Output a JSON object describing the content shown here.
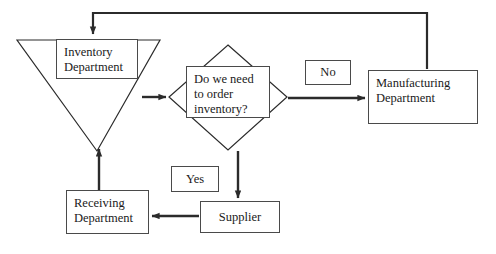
{
  "diagram": {
    "stroke_color": "#2b2b2b",
    "fill_color": "#ffffff",
    "text_color": "#1a1a1a",
    "nodes": {
      "inventory_department": {
        "label": "Inventory\nDepartment",
        "shape": "inverted-triangle"
      },
      "decision": {
        "label": "Do we need\nto order\ninventory?",
        "shape": "diamond"
      },
      "manufacturing_department": {
        "label": "Manufacturing\nDepartment",
        "shape": "rectangle"
      },
      "receiving_department": {
        "label": "Receiving\nDepartment",
        "shape": "rectangle"
      },
      "supplier": {
        "label": "Supplier",
        "shape": "rectangle"
      }
    },
    "edge_labels": {
      "yes": "Yes",
      "no": "No"
    }
  }
}
